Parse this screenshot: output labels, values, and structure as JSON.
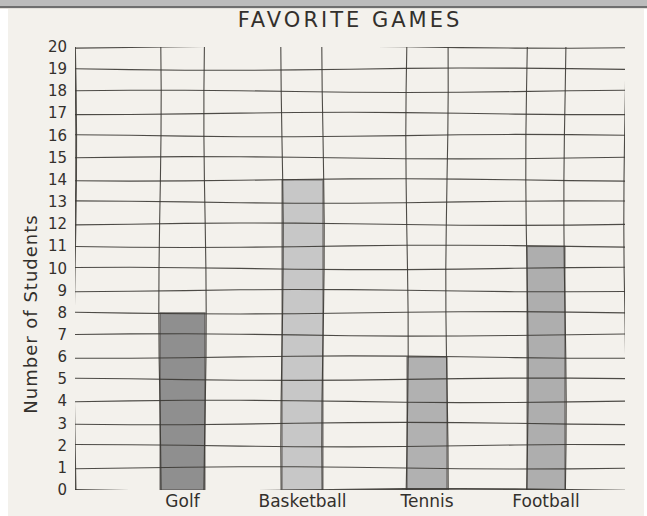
{
  "chart_data": {
    "type": "bar",
    "title": "FAVORITE GAMES",
    "ylabel": "Number of Students",
    "xlabel": "",
    "categories": [
      "Golf",
      "Basketball",
      "Tennis",
      "Football"
    ],
    "values": [
      8,
      14,
      6,
      11
    ],
    "ylim": [
      0,
      20
    ],
    "ytick_step": 1,
    "yticks": [
      20,
      19,
      18,
      17,
      16,
      15,
      14,
      13,
      12,
      11,
      10,
      9,
      8,
      7,
      6,
      5,
      4,
      3,
      2,
      1,
      0
    ],
    "grid": "on",
    "legend": "none",
    "bar_colors": [
      "#8f8f8f",
      "#c7c7c7",
      "#b1b1b1",
      "#aeaeae"
    ],
    "line_color": "#3b3834",
    "text_color": "#33302c",
    "paper_color": "#f3f1ec",
    "top_strip_color": "#bcbcbc",
    "top_strip_edge_color": "#6f6f6f"
  }
}
